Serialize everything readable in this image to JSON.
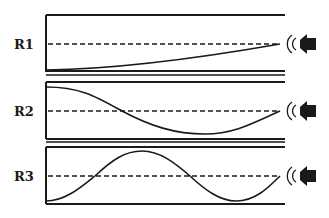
{
  "diagram": {
    "type": "standing-wave-resonance-tubes",
    "stroke_color": "#1a1a1a",
    "background": "#ffffff",
    "tubes": [
      {
        "label": "R1",
        "top": 15,
        "bottom": 72,
        "axis": 44,
        "wave": "quarter-wavelength",
        "speaker": "speaker-icon"
      },
      {
        "label": "R2",
        "top": 81,
        "bottom": 138,
        "axis": 111,
        "wave": "three-quarter-wavelength",
        "speaker": "speaker-icon"
      },
      {
        "label": "R3",
        "top": 146,
        "bottom": 204,
        "axis": 176,
        "wave": "five-quarter-wavelength",
        "speaker": "speaker-icon"
      }
    ]
  }
}
